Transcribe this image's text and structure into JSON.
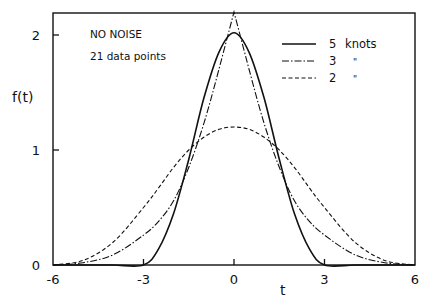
{
  "chart_data": {
    "type": "line",
    "title": "",
    "annotations": [
      "NO NOISE",
      "21 data points"
    ],
    "xlabel": "t",
    "ylabel": "f(t)",
    "xlim": [
      -6,
      6
    ],
    "ylim": [
      0,
      2.2
    ],
    "xticks": [
      -6,
      -3,
      0,
      3,
      6
    ],
    "xtick_labels": [
      "-6",
      "-3",
      "0",
      "3",
      "6"
    ],
    "yticks": [
      0,
      1,
      2
    ],
    "ytick_labels": [
      "0",
      "1",
      "2"
    ],
    "grid": false,
    "legend_position": "upper right",
    "x": [
      -6,
      -5,
      -4,
      -3,
      -2.5,
      -2,
      -1.5,
      -1,
      -0.5,
      0,
      0.5,
      1,
      1.5,
      2,
      2.5,
      3,
      4,
      5,
      6
    ],
    "series": [
      {
        "name": "5 knots",
        "style": "solid",
        "values": [
          0,
          0,
          0,
          0,
          0.14,
          0.45,
          0.92,
          1.45,
          1.85,
          2.02,
          1.85,
          1.45,
          0.92,
          0.45,
          0.14,
          0,
          0,
          0,
          0
        ]
      },
      {
        "name": "3 knots",
        "style": "dash-dot",
        "values": [
          0,
          0.02,
          0.09,
          0.26,
          0.38,
          0.56,
          0.85,
          1.23,
          1.7,
          2.2,
          1.7,
          1.23,
          0.85,
          0.56,
          0.38,
          0.26,
          0.09,
          0.02,
          0
        ]
      },
      {
        "name": "2 knots",
        "style": "dashed",
        "values": [
          0,
          0.04,
          0.2,
          0.5,
          0.67,
          0.85,
          1.0,
          1.11,
          1.18,
          1.2,
          1.18,
          1.11,
          1.0,
          0.85,
          0.67,
          0.5,
          0.2,
          0.04,
          0
        ]
      }
    ]
  },
  "legend": {
    "items": [
      {
        "number": "5",
        "text": "knots"
      },
      {
        "number": "3",
        "text": "\""
      },
      {
        "number": "2",
        "text": "\""
      }
    ]
  },
  "colors": {
    "ink": "#111111",
    "background": "#ffffff"
  }
}
